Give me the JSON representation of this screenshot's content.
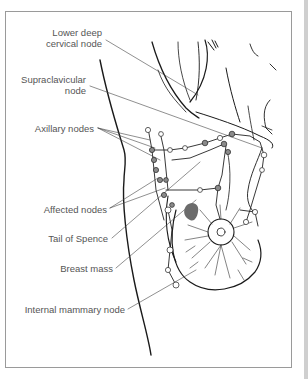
{
  "diagram": {
    "type": "anatomical illustration",
    "labels": [
      {
        "id": "lower-deep-cervical",
        "lines": [
          "Lower deep",
          "cervical node"
        ]
      },
      {
        "id": "supraclavicular",
        "lines": [
          "Supraclavicular",
          "node"
        ]
      },
      {
        "id": "axillary",
        "lines": [
          "Axillary nodes"
        ]
      },
      {
        "id": "affected",
        "lines": [
          "Affected nodes"
        ]
      },
      {
        "id": "tail-of-spence",
        "lines": [
          "Tail of Spence"
        ]
      },
      {
        "id": "breast-mass",
        "lines": [
          "Breast mass"
        ]
      },
      {
        "id": "internal-mammary",
        "lines": [
          "Internal mammary node"
        ]
      }
    ],
    "colors": {
      "label_text": "#555555",
      "line_art": "#1a1a1a",
      "leader_line": "#444444",
      "node_fill": "#8a8a8a",
      "affected_fill": "#6b6b6b",
      "frame_border": "#9a9a9a"
    }
  }
}
